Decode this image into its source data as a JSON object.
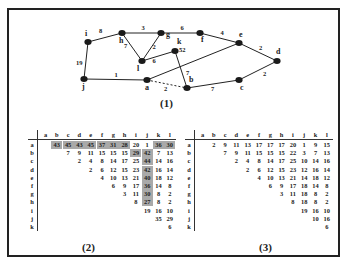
{
  "figure": {
    "graph": {
      "caption": "(1)",
      "nodes": [
        {
          "id": "i",
          "label": "i",
          "x": 88,
          "y": 42
        },
        {
          "id": "h",
          "label": "h",
          "x": 122,
          "y": 33
        },
        {
          "id": "g",
          "label": "g",
          "x": 161,
          "y": 33
        },
        {
          "id": "f",
          "label": "f",
          "x": 200,
          "y": 33
        },
        {
          "id": "e",
          "label": "e",
          "x": 239,
          "y": 43
        },
        {
          "id": "d",
          "label": "d",
          "x": 277,
          "y": 61
        },
        {
          "id": "k",
          "label": "k",
          "x": 175,
          "y": 51
        },
        {
          "id": "l",
          "label": "l",
          "x": 142,
          "y": 61
        },
        {
          "id": "j",
          "label": "j",
          "x": 84,
          "y": 79
        },
        {
          "id": "a",
          "label": "a",
          "x": 147,
          "y": 80
        },
        {
          "id": "b",
          "label": "b",
          "x": 187,
          "y": 88
        },
        {
          "id": "c",
          "label": "c",
          "x": 239,
          "y": 80
        }
      ],
      "edges": [
        {
          "from": "i",
          "to": "h",
          "weight": "8",
          "dashed": false
        },
        {
          "from": "h",
          "to": "g",
          "weight": "3",
          "dashed": false
        },
        {
          "from": "g",
          "to": "f",
          "weight": "6",
          "dashed": false
        },
        {
          "from": "f",
          "to": "e",
          "weight": "4",
          "dashed": false
        },
        {
          "from": "e",
          "to": "d",
          "weight": "2",
          "dashed": false
        },
        {
          "from": "d",
          "to": "c",
          "weight": "2",
          "dashed": false
        },
        {
          "from": "c",
          "to": "b",
          "weight": "7",
          "dashed": false
        },
        {
          "from": "b",
          "to": "k",
          "weight": "7",
          "dashed": false
        },
        {
          "from": "a",
          "to": "b",
          "weight": "2",
          "dashed": true
        },
        {
          "from": "j",
          "to": "a",
          "weight": "1",
          "dashed": false
        },
        {
          "from": "i",
          "to": "j",
          "weight": "19",
          "dashed": false
        },
        {
          "from": "h",
          "to": "l",
          "weight": "7",
          "dashed": false
        },
        {
          "from": "g",
          "to": "l",
          "weight": "2",
          "dashed": false
        },
        {
          "from": "l",
          "to": "k",
          "weight": "6",
          "dashed": false
        },
        {
          "from": "a",
          "to": "e",
          "weight": "52",
          "dashed": false
        }
      ]
    },
    "table2": {
      "caption": "(2)",
      "columns": [
        "a",
        "b",
        "c",
        "d",
        "e",
        "f",
        "g",
        "h",
        "i",
        "j",
        "k",
        "l"
      ],
      "rows": [
        {
          "label": "a",
          "cells": [
            "",
            "43",
            "45",
            "43",
            "45",
            "37",
            "31",
            "28",
            "20",
            "1",
            "36",
            "30"
          ],
          "shaded": [
            1,
            2,
            3,
            4,
            5,
            6,
            7,
            10,
            11
          ]
        },
        {
          "label": "b",
          "cells": [
            "",
            "",
            "7",
            "9",
            "11",
            "15",
            "15",
            "15",
            "29",
            "42",
            "7",
            "13"
          ],
          "shaded": [
            8,
            9
          ]
        },
        {
          "label": "c",
          "cells": [
            "",
            "",
            "",
            "2",
            "4",
            "8",
            "14",
            "17",
            "25",
            "44",
            "14",
            "16"
          ],
          "shaded": [
            9
          ]
        },
        {
          "label": "d",
          "cells": [
            "",
            "",
            "",
            "",
            "2",
            "6",
            "12",
            "15",
            "23",
            "42",
            "16",
            "14"
          ],
          "shaded": [
            9
          ]
        },
        {
          "label": "e",
          "cells": [
            "",
            "",
            "",
            "",
            "",
            "4",
            "10",
            "13",
            "21",
            "40",
            "18",
            "12"
          ],
          "shaded": [
            9
          ]
        },
        {
          "label": "f",
          "cells": [
            "",
            "",
            "",
            "",
            "",
            "",
            "6",
            "9",
            "17",
            "36",
            "14",
            "8"
          ],
          "shaded": [
            9
          ]
        },
        {
          "label": "g",
          "cells": [
            "",
            "",
            "",
            "",
            "",
            "",
            "",
            "3",
            "11",
            "30",
            "8",
            "2"
          ],
          "shaded": [
            9
          ]
        },
        {
          "label": "h",
          "cells": [
            "",
            "",
            "",
            "",
            "",
            "",
            "",
            "",
            "8",
            "27",
            "8",
            "2"
          ],
          "shaded": [
            9
          ]
        },
        {
          "label": "i",
          "cells": [
            "",
            "",
            "",
            "",
            "",
            "",
            "",
            "",
            "",
            "19",
            "16",
            "10"
          ],
          "shaded": []
        },
        {
          "label": "j",
          "cells": [
            "",
            "",
            "",
            "",
            "",
            "",
            "",
            "",
            "",
            "",
            "35",
            "29"
          ],
          "shaded": []
        },
        {
          "label": "k",
          "cells": [
            "",
            "",
            "",
            "",
            "",
            "",
            "",
            "",
            "",
            "",
            "",
            "6"
          ],
          "shaded": []
        }
      ]
    },
    "table3": {
      "caption": "(3)",
      "columns": [
        "a",
        "b",
        "c",
        "d",
        "e",
        "f",
        "g",
        "h",
        "i",
        "j",
        "k",
        "l"
      ],
      "rows": [
        {
          "label": "a",
          "cells": [
            "",
            "2",
            "9",
            "11",
            "13",
            "17",
            "17",
            "17",
            "20",
            "1",
            "9",
            "15"
          ]
        },
        {
          "label": "b",
          "cells": [
            "",
            "",
            "7",
            "9",
            "11",
            "15",
            "15",
            "15",
            "22",
            "3",
            "7",
            "13"
          ]
        },
        {
          "label": "c",
          "cells": [
            "",
            "",
            "",
            "2",
            "4",
            "8",
            "14",
            "17",
            "25",
            "10",
            "14",
            "16"
          ]
        },
        {
          "label": "d",
          "cells": [
            "",
            "",
            "",
            "",
            "2",
            "6",
            "12",
            "15",
            "23",
            "12",
            "16",
            "14"
          ]
        },
        {
          "label": "e",
          "cells": [
            "",
            "",
            "",
            "",
            "",
            "4",
            "10",
            "13",
            "21",
            "14",
            "18",
            "12"
          ]
        },
        {
          "label": "f",
          "cells": [
            "",
            "",
            "",
            "",
            "",
            "",
            "6",
            "9",
            "17",
            "18",
            "14",
            "8"
          ]
        },
        {
          "label": "g",
          "cells": [
            "",
            "",
            "",
            "",
            "",
            "",
            "",
            "3",
            "11",
            "18",
            "8",
            "2"
          ]
        },
        {
          "label": "h",
          "cells": [
            "",
            "",
            "",
            "",
            "",
            "",
            "",
            "",
            "8",
            "18",
            "8",
            "2"
          ]
        },
        {
          "label": "i",
          "cells": [
            "",
            "",
            "",
            "",
            "",
            "",
            "",
            "",
            "",
            "19",
            "16",
            "10"
          ]
        },
        {
          "label": "j",
          "cells": [
            "",
            "",
            "",
            "",
            "",
            "",
            "",
            "",
            "",
            "",
            "10",
            "16"
          ]
        },
        {
          "label": "k",
          "cells": [
            "",
            "",
            "",
            "",
            "",
            "",
            "",
            "",
            "",
            "",
            "",
            "6"
          ]
        }
      ]
    },
    "colors": {
      "ink": "#222222",
      "shade": "#a9a9a9",
      "background": "#ffffff"
    }
  }
}
